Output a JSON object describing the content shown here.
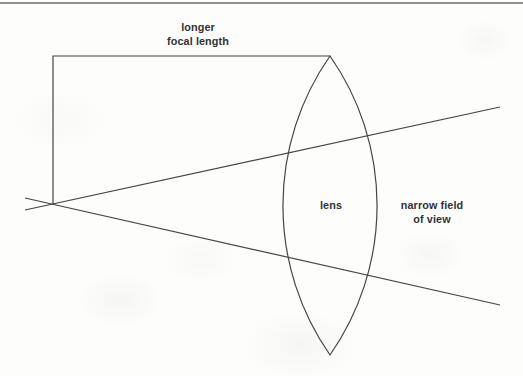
{
  "figure": {
    "labels": {
      "focal_length": "longer\nfocal length",
      "lens": "lens",
      "field_of_view": "narrow field\nof view"
    }
  },
  "colors": {
    "line": "#454545",
    "text": "#333333",
    "top_rule": "#909090",
    "paper": "#fdfdfc"
  }
}
